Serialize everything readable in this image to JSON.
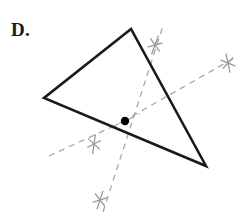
{
  "figure": {
    "label": "D.",
    "caption_letter": "D.",
    "background_color": "#ffffff",
    "triangle": {
      "name": "scalene-triangle",
      "stroke_color": "#1a1a1a",
      "stroke_width": 2.6,
      "fill": "none",
      "vertices": [
        {
          "name": "apex-top",
          "x": 131,
          "y": 29
        },
        {
          "name": "vertex-left",
          "x": 44,
          "y": 98
        },
        {
          "name": "vertex-bottom-right",
          "x": 206,
          "y": 166
        }
      ],
      "points_attr": "131,29 44,98 206,166"
    },
    "center_point": {
      "name": "centroid-dot",
      "x": 125,
      "y": 121,
      "radius": 4.2,
      "color": "#000000"
    },
    "construction_lines": {
      "stroke_color": "#a8a8a8",
      "stroke_width": 1.3,
      "dash_pattern": "6 5",
      "lines": [
        {
          "name": "dashed-line-upper-right-long",
          "x1": 113,
          "y1": 127,
          "x2": 236,
          "y2": 57
        },
        {
          "name": "dashed-line-upper-steep",
          "x1": 103,
          "y1": 212,
          "x2": 163,
          "y2": 26
        },
        {
          "name": "dashed-line-lower-left",
          "x1": 49,
          "y1": 156,
          "x2": 140,
          "y2": 114
        }
      ]
    },
    "tick_marks": [
      {
        "name": "tick-mark-upper",
        "x": 155,
        "y": 45,
        "size": 15,
        "rotation": 20,
        "stroke_color": "#999999"
      },
      {
        "name": "tick-mark-right",
        "x": 228,
        "y": 63,
        "size": 15,
        "rotation": -12,
        "stroke_color": "#999999"
      },
      {
        "name": "tick-mark-lower-left",
        "x": 94,
        "y": 144,
        "size": 15,
        "rotation": 8,
        "stroke_color": "#999999"
      },
      {
        "name": "tick-mark-bottom",
        "x": 100,
        "y": 200,
        "size": 15,
        "rotation": 18,
        "stroke_color": "#999999"
      }
    ]
  }
}
